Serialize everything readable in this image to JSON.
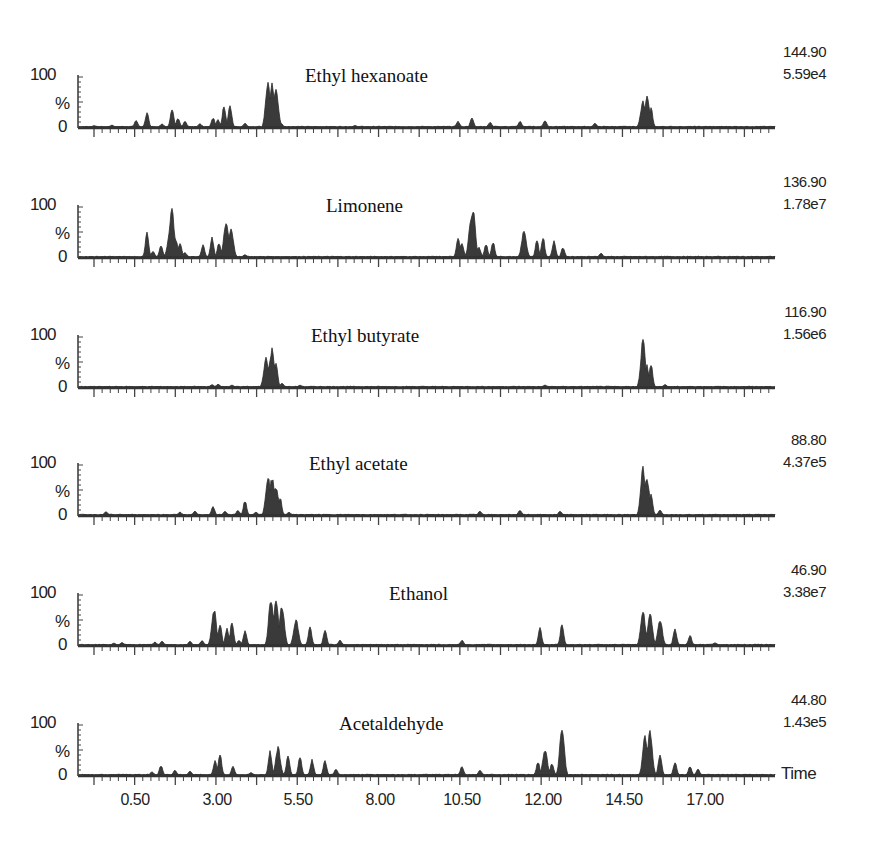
{
  "chart_data": [
    {
      "type": "line",
      "title": "Ethyl hexanoate",
      "mz": "144.90",
      "intensity": "5.59e4",
      "ylabel": "%",
      "yticks": [
        "0",
        "100"
      ],
      "ylim": [
        0,
        100
      ],
      "peaks": [
        {
          "x": 94,
          "h": 3
        },
        {
          "x": 112,
          "h": 4
        },
        {
          "x": 136,
          "h": 14
        },
        {
          "x": 147,
          "h": 30
        },
        {
          "x": 162,
          "h": 7
        },
        {
          "x": 172,
          "h": 40
        },
        {
          "x": 178,
          "h": 18
        },
        {
          "x": 185,
          "h": 12
        },
        {
          "x": 200,
          "h": 7
        },
        {
          "x": 213,
          "h": 20
        },
        {
          "x": 218,
          "h": 15
        },
        {
          "x": 224,
          "h": 45
        },
        {
          "x": 230,
          "h": 47
        },
        {
          "x": 245,
          "h": 8
        },
        {
          "x": 268,
          "h": 100
        },
        {
          "x": 272,
          "h": 95
        },
        {
          "x": 276,
          "h": 82
        },
        {
          "x": 281,
          "h": 8
        },
        {
          "x": 355,
          "h": 3
        },
        {
          "x": 458,
          "h": 12
        },
        {
          "x": 472,
          "h": 20
        },
        {
          "x": 490,
          "h": 10
        },
        {
          "x": 520,
          "h": 12
        },
        {
          "x": 545,
          "h": 14
        },
        {
          "x": 595,
          "h": 8
        },
        {
          "x": 643,
          "h": 55
        },
        {
          "x": 647,
          "h": 62
        },
        {
          "x": 651,
          "h": 40
        }
      ]
    },
    {
      "type": "line",
      "title": "Limonene",
      "mz": "136.90",
      "intensity": "1.78e7",
      "ylabel": "%",
      "yticks": [
        "0",
        "100"
      ],
      "ylim": [
        0,
        100
      ],
      "peaks": [
        {
          "x": 147,
          "h": 50
        },
        {
          "x": 153,
          "h": 12
        },
        {
          "x": 161,
          "h": 25
        },
        {
          "x": 170,
          "h": 60
        },
        {
          "x": 172,
          "h": 100
        },
        {
          "x": 176,
          "h": 38
        },
        {
          "x": 180,
          "h": 30
        },
        {
          "x": 185,
          "h": 10
        },
        {
          "x": 203,
          "h": 25
        },
        {
          "x": 212,
          "h": 40
        },
        {
          "x": 219,
          "h": 30
        },
        {
          "x": 226,
          "h": 75
        },
        {
          "x": 231,
          "h": 62
        },
        {
          "x": 245,
          "h": 5
        },
        {
          "x": 458,
          "h": 40
        },
        {
          "x": 462,
          "h": 30
        },
        {
          "x": 471,
          "h": 85
        },
        {
          "x": 473,
          "h": 100
        },
        {
          "x": 479,
          "h": 20
        },
        {
          "x": 486,
          "h": 28
        },
        {
          "x": 493,
          "h": 32
        },
        {
          "x": 524,
          "h": 55
        },
        {
          "x": 537,
          "h": 35
        },
        {
          "x": 543,
          "h": 42
        },
        {
          "x": 554,
          "h": 35
        },
        {
          "x": 563,
          "h": 20
        },
        {
          "x": 601,
          "h": 8
        }
      ]
    },
    {
      "type": "line",
      "title": "Ethyl butyrate",
      "mz": "116.90",
      "intensity": "1.56e6",
      "ylabel": "%",
      "yticks": [
        "0",
        "100"
      ],
      "ylim": [
        0,
        100
      ],
      "peaks": [
        {
          "x": 212,
          "h": 5
        },
        {
          "x": 218,
          "h": 6
        },
        {
          "x": 232,
          "h": 4
        },
        {
          "x": 266,
          "h": 60
        },
        {
          "x": 269,
          "h": 45
        },
        {
          "x": 272,
          "h": 80
        },
        {
          "x": 276,
          "h": 50
        },
        {
          "x": 282,
          "h": 8
        },
        {
          "x": 300,
          "h": 4
        },
        {
          "x": 545,
          "h": 4
        },
        {
          "x": 643,
          "h": 100
        },
        {
          "x": 647,
          "h": 45
        },
        {
          "x": 651,
          "h": 48
        },
        {
          "x": 665,
          "h": 5
        }
      ]
    },
    {
      "type": "line",
      "title": "Ethyl acetate",
      "mz": "88.80",
      "intensity": "4.37e5",
      "ylabel": "%",
      "yticks": [
        "0",
        "100"
      ],
      "ylim": [
        0,
        100
      ],
      "peaks": [
        {
          "x": 106,
          "h": 7
        },
        {
          "x": 180,
          "h": 6
        },
        {
          "x": 195,
          "h": 8
        },
        {
          "x": 213,
          "h": 18
        },
        {
          "x": 225,
          "h": 8
        },
        {
          "x": 238,
          "h": 10
        },
        {
          "x": 245,
          "h": 30
        },
        {
          "x": 256,
          "h": 6
        },
        {
          "x": 268,
          "h": 80
        },
        {
          "x": 272,
          "h": 78
        },
        {
          "x": 276,
          "h": 60
        },
        {
          "x": 280,
          "h": 38
        },
        {
          "x": 289,
          "h": 6
        },
        {
          "x": 480,
          "h": 8
        },
        {
          "x": 520,
          "h": 10
        },
        {
          "x": 560,
          "h": 8
        },
        {
          "x": 643,
          "h": 100
        },
        {
          "x": 647,
          "h": 80
        },
        {
          "x": 651,
          "h": 45
        },
        {
          "x": 660,
          "h": 10
        }
      ]
    },
    {
      "type": "line",
      "title": "Ethanol",
      "mz": "46.90",
      "intensity": "3.38e7",
      "ylabel": "%",
      "yticks": [
        "0",
        "100"
      ],
      "ylim": [
        0,
        100
      ],
      "peaks": [
        {
          "x": 114,
          "h": 4
        },
        {
          "x": 122,
          "h": 5
        },
        {
          "x": 155,
          "h": 6
        },
        {
          "x": 162,
          "h": 8
        },
        {
          "x": 190,
          "h": 8
        },
        {
          "x": 202,
          "h": 9
        },
        {
          "x": 212,
          "h": 25
        },
        {
          "x": 214,
          "h": 75
        },
        {
          "x": 220,
          "h": 45
        },
        {
          "x": 227,
          "h": 35
        },
        {
          "x": 232,
          "h": 50
        },
        {
          "x": 239,
          "h": 10
        },
        {
          "x": 245,
          "h": 30
        },
        {
          "x": 271,
          "h": 100
        },
        {
          "x": 276,
          "h": 95
        },
        {
          "x": 282,
          "h": 85
        },
        {
          "x": 296,
          "h": 55
        },
        {
          "x": 310,
          "h": 40
        },
        {
          "x": 325,
          "h": 33
        },
        {
          "x": 340,
          "h": 10
        },
        {
          "x": 462,
          "h": 10
        },
        {
          "x": 540,
          "h": 35
        },
        {
          "x": 562,
          "h": 45
        },
        {
          "x": 643,
          "h": 70
        },
        {
          "x": 650,
          "h": 68
        },
        {
          "x": 660,
          "h": 55
        },
        {
          "x": 675,
          "h": 35
        },
        {
          "x": 690,
          "h": 20
        },
        {
          "x": 715,
          "h": 5
        }
      ]
    },
    {
      "type": "line",
      "title": "Acetaldehyde",
      "mz": "44.80",
      "intensity": "1.43e5",
      "ylabel": "%",
      "yticks": [
        "0",
        "100"
      ],
      "ylim": [
        0,
        100
      ],
      "peaks": [
        {
          "x": 152,
          "h": 7
        },
        {
          "x": 161,
          "h": 20
        },
        {
          "x": 175,
          "h": 10
        },
        {
          "x": 190,
          "h": 8
        },
        {
          "x": 215,
          "h": 30
        },
        {
          "x": 220,
          "h": 45
        },
        {
          "x": 233,
          "h": 18
        },
        {
          "x": 251,
          "h": 5
        },
        {
          "x": 270,
          "h": 50
        },
        {
          "x": 278,
          "h": 58
        },
        {
          "x": 288,
          "h": 42
        },
        {
          "x": 300,
          "h": 40
        },
        {
          "x": 312,
          "h": 32
        },
        {
          "x": 325,
          "h": 30
        },
        {
          "x": 336,
          "h": 12
        },
        {
          "x": 462,
          "h": 18
        },
        {
          "x": 480,
          "h": 10
        },
        {
          "x": 538,
          "h": 28
        },
        {
          "x": 545,
          "h": 55
        },
        {
          "x": 552,
          "h": 25
        },
        {
          "x": 562,
          "h": 100
        },
        {
          "x": 645,
          "h": 80
        },
        {
          "x": 650,
          "h": 95
        },
        {
          "x": 660,
          "h": 45
        },
        {
          "x": 675,
          "h": 28
        },
        {
          "x": 690,
          "h": 18
        },
        {
          "x": 698,
          "h": 12
        }
      ]
    }
  ],
  "x_axis": {
    "label": "Time",
    "ticks": [
      {
        "label": "0.50",
        "x": 135
      },
      {
        "label": "3.00",
        "x": 217
      },
      {
        "label": "5.50",
        "x": 298
      },
      {
        "label": "8.00",
        "x": 380
      },
      {
        "label": "10.50",
        "x": 462
      },
      {
        "label": "12.00",
        "x": 543
      },
      {
        "label": "14.50",
        "x": 624
      },
      {
        "label": "17.00",
        "x": 705
      }
    ]
  },
  "y_axis": {
    "top_label": "100",
    "mid_label": "%",
    "bottom_label": "0"
  }
}
